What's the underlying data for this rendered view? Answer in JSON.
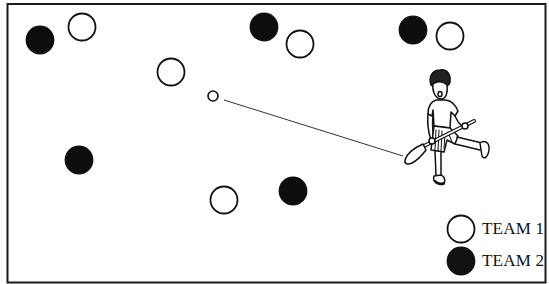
{
  "diagram": {
    "frame": {
      "x": 7,
      "y": 4,
      "width": 539,
      "height": 279,
      "stroke": "#1a1a1a"
    },
    "players": [
      {
        "team": "team2",
        "x": 40,
        "y": 40
      },
      {
        "team": "team1",
        "x": 82,
        "y": 27
      },
      {
        "team": "team2",
        "x": 264,
        "y": 27
      },
      {
        "team": "team1",
        "x": 300,
        "y": 44
      },
      {
        "team": "team2",
        "x": 413,
        "y": 30
      },
      {
        "team": "team1",
        "x": 450,
        "y": 36
      },
      {
        "team": "team1",
        "x": 171,
        "y": 72
      },
      {
        "team": "team2",
        "x": 79,
        "y": 160
      },
      {
        "team": "team1",
        "x": 224,
        "y": 200
      },
      {
        "team": "team2",
        "x": 293,
        "y": 191
      }
    ],
    "ball": {
      "x": 213,
      "y": 96,
      "r": 5
    },
    "pass_line": {
      "x1": 224,
      "y1": 100,
      "x2": 403,
      "y2": 156
    },
    "striker": {
      "label": "hurler-with-hurley",
      "x": 440,
      "y": 130
    }
  },
  "legend": {
    "items": [
      {
        "label": "TEAM 1",
        "fill": "#ffffff",
        "stroke": "#111111"
      },
      {
        "label": "TEAM 2",
        "fill": "#111111",
        "stroke": "#111111"
      }
    ]
  },
  "colors": {
    "team1_fill": "#ffffff",
    "team2_fill": "#0d0d0d",
    "ink": "#111111"
  }
}
